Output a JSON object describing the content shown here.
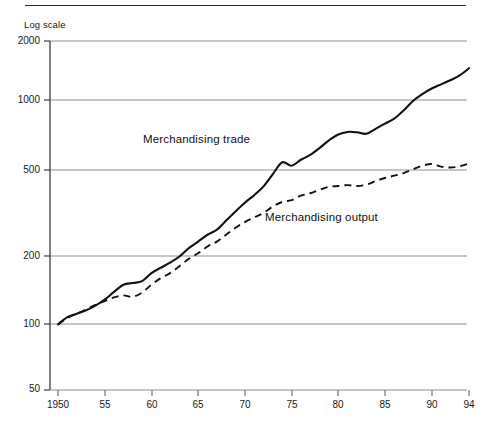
{
  "chart_data": {
    "type": "line",
    "title": "",
    "subtitle": "",
    "scale_note": "Log scale",
    "xlabel": "",
    "ylabel": "",
    "grid": true,
    "grid_axis": "y",
    "legend_position": "inline-annotations",
    "y_axis": {
      "scale": "log",
      "ylim": [
        50,
        2000
      ],
      "ticks": [
        50,
        100,
        200,
        500,
        1000,
        2000
      ],
      "tick_labels": [
        "50",
        "100",
        "200",
        "500",
        "1000",
        "2000"
      ]
    },
    "x_axis": {
      "xlim": [
        1950,
        1994
      ],
      "ticks": [
        1950,
        1955,
        1960,
        1965,
        1970,
        1975,
        1980,
        1985,
        1990,
        1994
      ],
      "tick_labels": [
        "1950",
        "55",
        "60",
        "65",
        "70",
        "75",
        "80",
        "85",
        "90",
        "94"
      ]
    },
    "series": [
      {
        "name": "Merchandising trade",
        "style": "solid",
        "color": "#111111",
        "x": [
          1950,
          1951,
          1952,
          1953,
          1954,
          1955,
          1956,
          1957,
          1958,
          1959,
          1960,
          1961,
          1962,
          1963,
          1964,
          1965,
          1966,
          1967,
          1968,
          1969,
          1970,
          1971,
          1972,
          1973,
          1974,
          1975,
          1976,
          1977,
          1978,
          1979,
          1980,
          1981,
          1982,
          1983,
          1984,
          1985,
          1986,
          1987,
          1988,
          1989,
          1990,
          1991,
          1992,
          1993,
          1994
        ],
        "values": [
          100,
          108,
          112,
          116,
          122,
          130,
          141,
          152,
          155,
          158,
          172,
          182,
          192,
          205,
          224,
          240,
          258,
          272,
          300,
          330,
          362,
          392,
          430,
          490,
          555,
          535,
          570,
          600,
          645,
          700,
          745,
          765,
          762,
          750,
          790,
          835,
          880,
          960,
          1060,
          1140,
          1210,
          1265,
          1320,
          1390,
          1500
        ],
        "annotation": {
          "text": "Merchandising trade",
          "x": 1959.5,
          "y": 760
        }
      },
      {
        "name": "Merchandising output",
        "style": "dashed",
        "color": "#111111",
        "x": [
          1950,
          1951,
          1952,
          1953,
          1954,
          1955,
          1956,
          1957,
          1958,
          1959,
          1960,
          1961,
          1962,
          1963,
          1964,
          1965,
          1966,
          1967,
          1968,
          1969,
          1970,
          1971,
          1972,
          1973,
          1974,
          1975,
          1976,
          1977,
          1978,
          1979,
          1980,
          1981,
          1982,
          1983,
          1984,
          1985,
          1986,
          1987,
          1988,
          1989,
          1990,
          1991,
          1992,
          1993,
          1994
        ],
        "values": [
          100,
          107,
          112,
          117,
          123,
          128,
          133,
          136,
          134,
          140,
          152,
          163,
          172,
          185,
          200,
          212,
          228,
          240,
          258,
          278,
          295,
          310,
          325,
          348,
          365,
          372,
          390,
          400,
          415,
          428,
          432,
          436,
          432,
          438,
          455,
          470,
          482,
          495,
          515,
          535,
          545,
          530,
          525,
          532,
          548
        ],
        "annotation": {
          "text": "Merchandising output",
          "x": 1976,
          "y": 310
        }
      }
    ]
  },
  "annotations": {
    "log_scale": "Log scale",
    "series_label_trade": "Merchandising trade",
    "series_label_output": "Merchandising output"
  },
  "colors": {
    "ink": "#111111",
    "gridline": "#8f8f8f",
    "axis": "#4a4a4a",
    "rule": "#2b2b2b",
    "background": "#ffffff"
  }
}
